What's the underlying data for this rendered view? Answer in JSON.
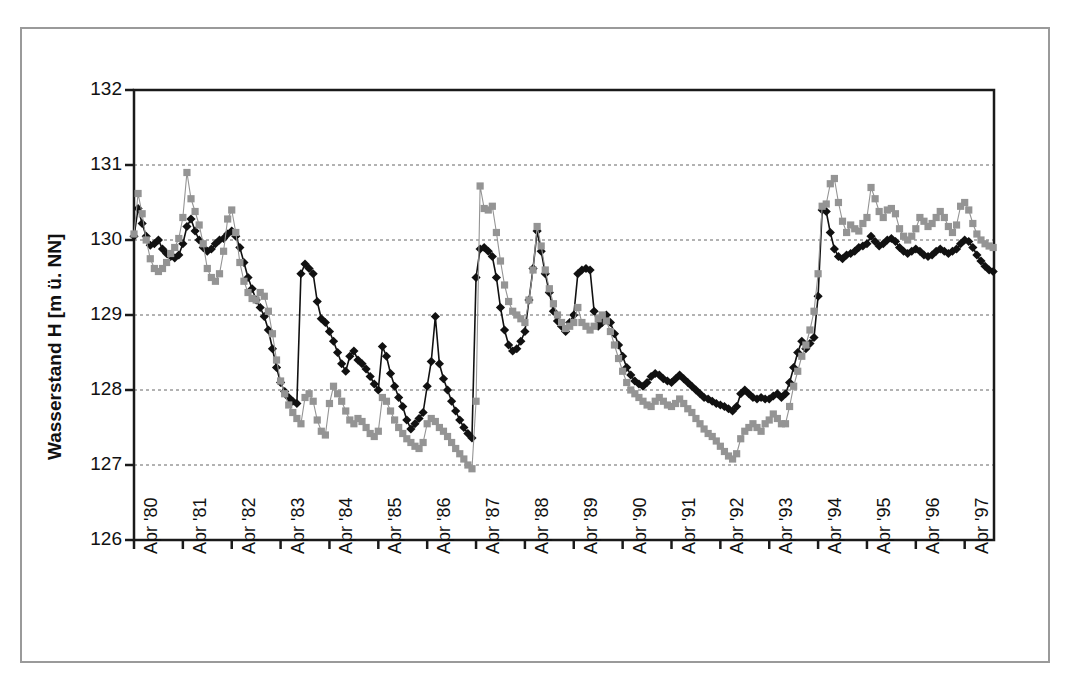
{
  "chart_data": {
    "type": "line",
    "title": "",
    "xlabel": "",
    "ylabel": "Wasserstand H [m ü. NN]",
    "ylim": [
      126,
      132
    ],
    "ytick_labels": [
      "126",
      "127",
      "128",
      "129",
      "130",
      "131",
      "132"
    ],
    "yticks": [
      126,
      127,
      128,
      129,
      130,
      131,
      132
    ],
    "gridlines": [
      127,
      128,
      129,
      130,
      131
    ],
    "grid": true,
    "legend": "none",
    "xtick_labels": [
      "Apr '80",
      "Apr '81",
      "Apr '82",
      "Apr '83",
      "Apr '84",
      "Apr '85",
      "Apr '86",
      "Apr '87",
      "Apr '88",
      "Apr '89",
      "Apr '90",
      "Apr '91",
      "Apr '92",
      "Apr '93",
      "Apr '94",
      "Apr '95",
      "Apr '96",
      "Apr '97"
    ],
    "x_start_label": "Apr '80",
    "x_months_per_tick": 12,
    "series": [
      {
        "name": "black-diamond-series",
        "color": "#111111",
        "marker": "diamond",
        "values": [
          130.05,
          130.42,
          130.22,
          130.05,
          129.93,
          129.95,
          130.0,
          129.88,
          129.82,
          129.78,
          129.76,
          129.8,
          129.95,
          130.18,
          130.28,
          130.12,
          130.0,
          129.9,
          129.85,
          129.88,
          129.95,
          130.0,
          130.02,
          130.08,
          130.12,
          130.05,
          129.9,
          129.7,
          129.5,
          129.35,
          129.2,
          129.1,
          128.98,
          128.8,
          128.55,
          128.3,
          128.1,
          127.98,
          127.9,
          127.85,
          127.82,
          129.55,
          129.68,
          129.62,
          129.55,
          129.18,
          128.95,
          128.9,
          128.78,
          128.65,
          128.5,
          128.35,
          128.25,
          128.45,
          128.52,
          128.4,
          128.35,
          128.28,
          128.18,
          128.08,
          128.0,
          128.58,
          128.45,
          128.22,
          128.05,
          127.9,
          127.78,
          127.6,
          127.48,
          127.55,
          127.62,
          127.7,
          128.05,
          128.38,
          128.98,
          128.35,
          128.15,
          128.0,
          127.85,
          127.72,
          127.6,
          127.5,
          127.42,
          127.36,
          129.5,
          129.88,
          129.9,
          129.85,
          129.78,
          129.5,
          129.1,
          128.8,
          128.6,
          128.52,
          128.55,
          128.65,
          128.78,
          129.2,
          129.62,
          130.12,
          129.85,
          129.55,
          129.3,
          129.05,
          128.92,
          128.85,
          128.78,
          128.9,
          129.0,
          129.55,
          129.6,
          129.62,
          129.6,
          129.05,
          128.85,
          128.9,
          129.0,
          128.9,
          128.75,
          128.6,
          128.45,
          128.3,
          128.2,
          128.12,
          128.08,
          128.05,
          128.1,
          128.18,
          128.22,
          128.2,
          128.15,
          128.12,
          128.1,
          128.15,
          128.2,
          128.15,
          128.1,
          128.05,
          128.0,
          127.95,
          127.9,
          127.88,
          127.85,
          127.82,
          127.8,
          127.78,
          127.75,
          127.72,
          127.78,
          127.95,
          128.0,
          127.95,
          127.9,
          127.88,
          127.9,
          127.88,
          127.88,
          127.92,
          127.95,
          127.9,
          127.95,
          128.1,
          128.3,
          128.5,
          128.65,
          128.55,
          128.62,
          128.7,
          129.25,
          130.4,
          130.38,
          130.1,
          129.88,
          129.78,
          129.75,
          129.8,
          129.82,
          129.85,
          129.9,
          129.92,
          129.95,
          130.05,
          129.98,
          129.92,
          129.95,
          130.0,
          130.02,
          129.98,
          129.9,
          129.85,
          129.82,
          129.85,
          129.88,
          129.85,
          129.8,
          129.78,
          129.8,
          129.85,
          129.88,
          129.85,
          129.82,
          129.85,
          129.88,
          129.95,
          130.0,
          129.98,
          129.9,
          129.8,
          129.72,
          129.65,
          129.6,
          129.58
        ]
      },
      {
        "name": "gray-square-series",
        "color": "#949494",
        "marker": "square",
        "values": [
          130.08,
          130.62,
          130.35,
          130.0,
          129.75,
          129.62,
          129.58,
          129.62,
          129.7,
          129.82,
          129.9,
          130.02,
          130.3,
          130.9,
          130.55,
          130.38,
          130.2,
          129.95,
          129.62,
          129.5,
          129.45,
          129.55,
          129.85,
          130.28,
          130.4,
          130.1,
          129.7,
          129.45,
          129.3,
          129.22,
          129.2,
          129.3,
          129.25,
          129.05,
          128.75,
          128.4,
          128.12,
          127.95,
          127.8,
          127.7,
          127.62,
          127.55,
          127.9,
          127.95,
          127.85,
          127.6,
          127.45,
          127.4,
          127.82,
          128.05,
          127.95,
          127.85,
          127.72,
          127.6,
          127.55,
          127.62,
          127.58,
          127.5,
          127.42,
          127.38,
          127.45,
          127.9,
          127.85,
          127.72,
          127.6,
          127.5,
          127.42,
          127.35,
          127.3,
          127.25,
          127.22,
          127.3,
          127.55,
          127.62,
          127.58,
          127.5,
          127.45,
          127.38,
          127.3,
          127.22,
          127.15,
          127.08,
          127.0,
          126.95,
          127.85,
          130.72,
          130.42,
          130.4,
          130.45,
          130.1,
          129.72,
          129.4,
          129.18,
          129.05,
          129.0,
          128.95,
          128.9,
          129.2,
          129.6,
          130.18,
          129.92,
          129.6,
          129.35,
          129.15,
          129.0,
          128.9,
          128.82,
          128.85,
          128.9,
          129.1,
          128.9,
          128.85,
          128.8,
          128.85,
          128.95,
          129.0,
          128.92,
          128.78,
          128.6,
          128.42,
          128.25,
          128.1,
          128.0,
          127.95,
          127.9,
          127.85,
          127.8,
          127.78,
          127.85,
          127.9,
          127.85,
          127.8,
          127.78,
          127.82,
          127.88,
          127.82,
          127.75,
          127.7,
          127.62,
          127.55,
          127.48,
          127.42,
          127.38,
          127.32,
          127.25,
          127.18,
          127.12,
          127.08,
          127.15,
          127.35,
          127.45,
          127.5,
          127.55,
          127.5,
          127.45,
          127.55,
          127.6,
          127.68,
          127.62,
          127.55,
          127.55,
          127.78,
          128.05,
          128.25,
          128.45,
          128.6,
          128.8,
          129.05,
          129.55,
          130.45,
          130.48,
          130.75,
          130.82,
          130.5,
          130.25,
          130.1,
          130.2,
          130.15,
          130.12,
          130.22,
          130.3,
          130.7,
          130.55,
          130.38,
          130.3,
          130.4,
          130.42,
          130.35,
          130.15,
          130.05,
          130.0,
          130.05,
          130.15,
          130.3,
          130.25,
          130.18,
          130.22,
          130.3,
          130.38,
          130.3,
          130.18,
          130.1,
          130.2,
          130.45,
          130.5,
          130.4,
          130.22,
          130.08,
          130.0,
          129.95,
          129.92,
          129.9
        ]
      }
    ]
  }
}
